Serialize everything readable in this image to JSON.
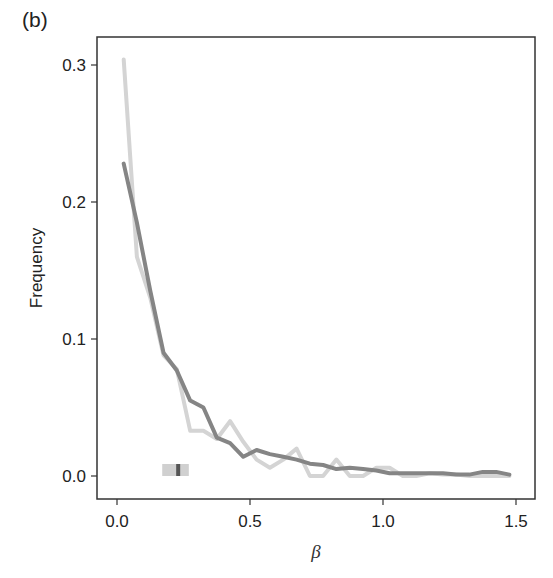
{
  "panel_label": "(b)",
  "chart_data": {
    "type": "line",
    "title": "",
    "xlabel": "β",
    "ylabel": "Frequency",
    "xlim": [
      -0.075,
      1.57
    ],
    "ylim": [
      -0.017,
      0.32
    ],
    "x_ticks": [
      0.0,
      0.5,
      1.0,
      1.5
    ],
    "x_tick_labels": [
      "0.0",
      "0.5",
      "1.0",
      "1.5"
    ],
    "y_ticks": [
      0.0,
      0.1,
      0.2,
      0.3
    ],
    "y_tick_labels": [
      "0.0",
      "0.1",
      "0.2",
      "0.3"
    ],
    "grid": false,
    "legend": null,
    "series": [
      {
        "name": "light",
        "color": "#d4d4d4",
        "x": [
          0.025,
          0.075,
          0.125,
          0.175,
          0.225,
          0.275,
          0.325,
          0.375,
          0.425,
          0.475,
          0.525,
          0.575,
          0.625,
          0.675,
          0.725,
          0.775,
          0.825,
          0.875,
          0.925,
          0.975,
          1.025,
          1.075,
          1.125,
          1.175,
          1.225,
          1.275,
          1.325,
          1.375,
          1.425,
          1.475
        ],
        "values": [
          0.304,
          0.16,
          0.13,
          0.088,
          0.078,
          0.033,
          0.033,
          0.027,
          0.04,
          0.025,
          0.012,
          0.006,
          0.012,
          0.02,
          0.0,
          0.0,
          0.012,
          0.0,
          0.0,
          0.006,
          0.006,
          0.0,
          0.0,
          0.002,
          0.001,
          0.001,
          0.0,
          0.0,
          0.0,
          0.0
        ]
      },
      {
        "name": "dark",
        "color": "#858585",
        "x": [
          0.025,
          0.075,
          0.125,
          0.175,
          0.225,
          0.275,
          0.325,
          0.375,
          0.425,
          0.475,
          0.525,
          0.575,
          0.625,
          0.675,
          0.725,
          0.775,
          0.825,
          0.875,
          0.925,
          0.975,
          1.025,
          1.075,
          1.125,
          1.175,
          1.225,
          1.275,
          1.325,
          1.375,
          1.425,
          1.475
        ],
        "values": [
          0.228,
          0.185,
          0.135,
          0.09,
          0.077,
          0.055,
          0.05,
          0.028,
          0.024,
          0.014,
          0.019,
          0.016,
          0.014,
          0.012,
          0.009,
          0.008,
          0.005,
          0.006,
          0.005,
          0.004,
          0.002,
          0.002,
          0.002,
          0.002,
          0.002,
          0.001,
          0.001,
          0.003,
          0.003,
          0.001
        ]
      }
    ],
    "annotations": [
      {
        "type": "interval-marker",
        "x_range": [
          0.17,
          0.27
        ],
        "x_center": 0.23,
        "y": 0.0,
        "color_band": "#d0d0d0",
        "color_center": "#555555"
      }
    ]
  }
}
